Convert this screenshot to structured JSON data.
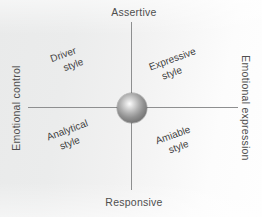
{
  "diagram": {
    "background_color": "#eceded",
    "axis_color": "#8e8f90",
    "text_color": "#4e4e4e",
    "sphere_color": "#8a8a8a"
  },
  "axes": {
    "top_label": "Assertive",
    "bottom_label": "Responsive",
    "left_label": "Emotional control",
    "right_label": "Emotional expression"
  },
  "quadrants": [
    {
      "name": "driver",
      "line1": "Driver",
      "line2": "style",
      "position": "top-left"
    },
    {
      "name": "expressive",
      "line1": "Expressive",
      "line2": "style",
      "position": "top-right"
    },
    {
      "name": "analytical",
      "line1": "Analytical",
      "line2": "style",
      "position": "bottom-left"
    },
    {
      "name": "amiable",
      "line1": "Amiable",
      "line2": "style",
      "position": "bottom-right"
    }
  ],
  "center": {
    "shape": "sphere-icon"
  }
}
